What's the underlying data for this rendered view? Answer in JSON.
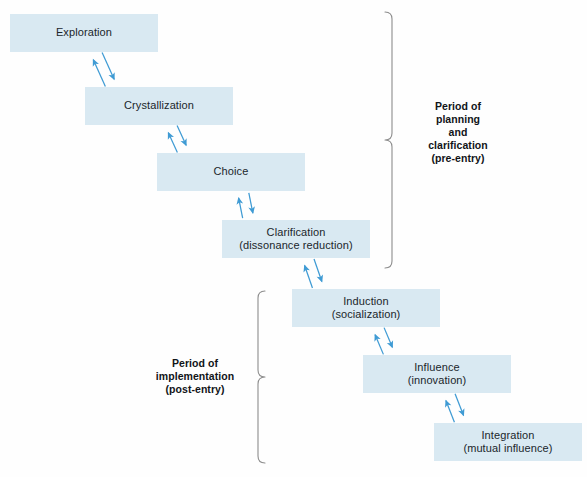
{
  "diagram": {
    "colors": {
      "box_fill": "#d9e9f2",
      "arrow": "#3f9bd4",
      "brace": "#8c8c8c",
      "text": "#20262b",
      "label_text": "#111418",
      "background": "#fefefe"
    },
    "stages": [
      {
        "id": "exploration",
        "line1": "Exploration",
        "line2": "",
        "x": 10,
        "y": 14,
        "w": 148,
        "h": 38
      },
      {
        "id": "crystallization",
        "line1": "Crystallization",
        "line2": "",
        "x": 85,
        "y": 87,
        "w": 148,
        "h": 38
      },
      {
        "id": "choice",
        "line1": "Choice",
        "line2": "",
        "x": 157,
        "y": 153,
        "w": 148,
        "h": 38
      },
      {
        "id": "clarification",
        "line1": "Clarification",
        "line2": "(dissonance reduction)",
        "x": 222,
        "y": 220,
        "w": 148,
        "h": 38
      },
      {
        "id": "induction",
        "line1": "Induction",
        "line2": "(socialization)",
        "x": 292,
        "y": 289,
        "w": 148,
        "h": 38
      },
      {
        "id": "influence",
        "line1": "Influence",
        "line2": "(innovation)",
        "x": 363,
        "y": 355,
        "w": 148,
        "h": 38
      },
      {
        "id": "integration",
        "line1": "Integration",
        "line2": "(mutual influence)",
        "x": 434,
        "y": 423,
        "w": 148,
        "h": 38
      }
    ],
    "connectors": [
      {
        "id": "exploration-crystallization",
        "from": "exploration",
        "to": "crystallization",
        "bidirectional": true
      },
      {
        "id": "crystallization-choice",
        "from": "crystallization",
        "to": "choice",
        "bidirectional": true
      },
      {
        "id": "choice-clarification",
        "from": "choice",
        "to": "clarification",
        "bidirectional": true
      },
      {
        "id": "clarification-induction",
        "from": "clarification",
        "to": "induction",
        "bidirectional": true
      },
      {
        "id": "induction-influence",
        "from": "induction",
        "to": "influence",
        "bidirectional": true
      },
      {
        "id": "influence-integration",
        "from": "influence",
        "to": "integration",
        "bidirectional": true
      }
    ],
    "periods": [
      {
        "id": "pre-entry",
        "lines": [
          "Period of",
          "planning",
          "and",
          "clarification",
          "(pre-entry)"
        ],
        "brace_side": "left",
        "brace_x": 392,
        "brace_top": 12,
        "brace_bottom": 268,
        "label_x": 408,
        "label_y": 100,
        "label_w": 100
      },
      {
        "id": "post-entry",
        "lines": [
          "Period of",
          "implementation",
          "(post-entry)"
        ],
        "brace_side": "right",
        "brace_x": 258,
        "brace_top": 291,
        "brace_bottom": 463,
        "label_x": 140,
        "label_y": 357,
        "label_w": 110
      }
    ]
  }
}
